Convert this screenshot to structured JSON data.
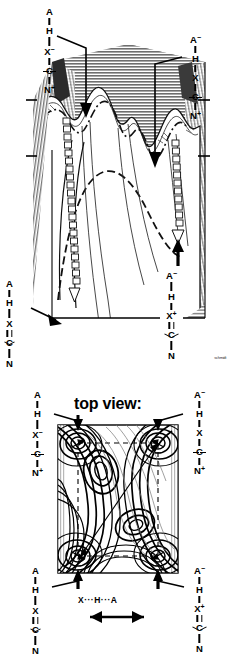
{
  "figure": {
    "panels": [
      {
        "id": "perspective",
        "caption": ""
      },
      {
        "id": "contour",
        "caption": "top view:"
      }
    ]
  },
  "headings": {
    "top_view": "top view:"
  },
  "axis": {
    "caption": "X···H···A",
    "x_symbol": "X",
    "h_symbol": "H",
    "a_symbol": "A",
    "dots": "···"
  },
  "artist_mark": "schmidt",
  "species": {
    "neutral_ion_pair": {
      "name": "X-minus / N-plus zwitterion with free A-H",
      "atoms": [
        {
          "symbol": "A",
          "charge": ""
        },
        {
          "symbol": "H",
          "charge": ""
        },
        {
          "symbol": "X",
          "charge": "−"
        },
        {
          "symbol": "C",
          "charge": ""
        },
        {
          "symbol": "N",
          "charge": "+"
        }
      ]
    },
    "a_anion_n_cation": {
      "name": "A-minus with N-plus, H bound to X",
      "atoms": [
        {
          "symbol": "A",
          "charge": "−"
        },
        {
          "symbol": "H",
          "charge": ""
        },
        {
          "symbol": "X",
          "charge": ""
        },
        {
          "symbol": "C",
          "charge": ""
        },
        {
          "symbol": "N",
          "charge": "+"
        }
      ]
    },
    "neutral_imine": {
      "name": "Neutral imine, A-H donor",
      "atoms": [
        {
          "symbol": "A",
          "charge": ""
        },
        {
          "symbol": "H",
          "charge": ""
        },
        {
          "symbol": "X",
          "charge": ""
        },
        {
          "symbol": "C",
          "charge": ""
        },
        {
          "symbol": "N",
          "charge": ""
        }
      ]
    },
    "a_anion_x_cation": {
      "name": "A-minus with X-plus iminium",
      "atoms": [
        {
          "symbol": "A",
          "charge": "−"
        },
        {
          "symbol": "H",
          "charge": ""
        },
        {
          "symbol": "X",
          "charge": "+"
        },
        {
          "symbol": "C",
          "charge": ""
        },
        {
          "symbol": "N",
          "charge": ""
        }
      ]
    }
  },
  "panel_3d": {
    "labels": {
      "top_left": "neutral_ion_pair",
      "top_right": "a_anion_n_cation",
      "bottom_left": "neutral_imine",
      "inset_box": "a_anion_x_cation"
    }
  },
  "panel_contour": {
    "labels": {
      "top_left": "neutral_ion_pair",
      "top_right": "a_anion_n_cation",
      "bottom_left": "neutral_imine",
      "bottom_right": "a_anion_x_cation"
    },
    "minima_markers": 4,
    "reaction_path": "diagonal"
  },
  "colors": {
    "ink": "#000000",
    "paper": "#ffffff",
    "hatch_dark": "#6b6b6b",
    "hatch_mid": "#9a9a9a",
    "hatch_light": "#c9c9c9"
  }
}
